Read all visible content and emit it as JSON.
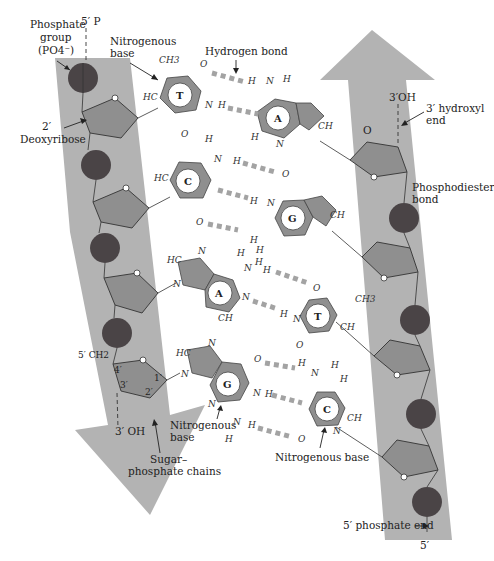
{
  "diagram": {
    "labels": {
      "phosphate_group_line1": "Phosphate",
      "phosphate_group_line2": "group",
      "phosphate_group_line3": "(PO4⁻)",
      "five_prime_p": "5′ P",
      "nitrogenous_base_top_line1": "Nitrogenous",
      "nitrogenous_base_top_line2": "base",
      "hydrogen_bond": "Hydrogen bond",
      "three_prime_oh_right": "3′OH",
      "three_prime_hydroxyl_line1": "3′ hydroxyl",
      "three_prime_hydroxyl_line2": "end",
      "deoxyribose_line1": "2′",
      "deoxyribose_line2": "Deoxyribose",
      "phosphodiester_line1": "Phosphodiester",
      "phosphodiester_line2": "bond",
      "five_prime_ch2": "5′ CH2",
      "carbon_4": "4′",
      "carbon_3": "3′",
      "carbon_2": "2′",
      "carbon_1": "1′",
      "three_prime_oh_left": "3′ OH",
      "nitrogenous_base_bottom_line1": "Nitrogenous",
      "nitrogenous_base_bottom_line2": "base",
      "sugar_phosphate_line1": "Sugar–",
      "sugar_phosphate_line2": "phosphate chains",
      "nitrogenous_base_right": "Nitrogenous base",
      "five_prime_phosphate_end": "5′ phosphate end",
      "five_prime_bottom": "5′"
    },
    "base_pairs": [
      {
        "left": "T",
        "right": "A",
        "hydrogen_bonds": 2
      },
      {
        "left": "C",
        "right": "G",
        "hydrogen_bonds": 3
      },
      {
        "left": "A",
        "right": "T",
        "hydrogen_bonds": 2
      },
      {
        "left": "G",
        "right": "C",
        "hydrogen_bonds": 3
      }
    ],
    "atoms": {
      "C": "C",
      "N": "N",
      "O": "O",
      "H": "H",
      "HC": "HC",
      "CH": "CH",
      "CH3": "CH3"
    },
    "left_strand_direction": "5′ to 3′ (down)",
    "right_strand_direction": "5′ to 3′ (up)",
    "colors": {
      "backbone_band": "#b3b3b3",
      "phosphate": "#4a4446",
      "sugar": "#8f8f8f",
      "hydrogen_bond": "#a3a3a3"
    }
  }
}
